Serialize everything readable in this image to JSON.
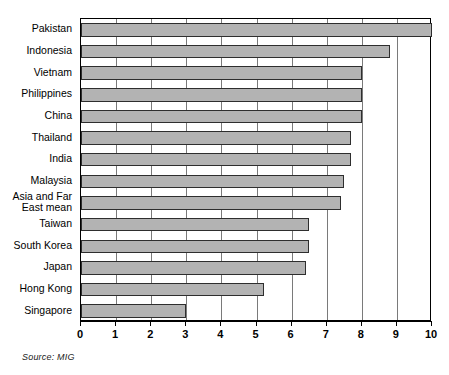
{
  "figure": {
    "source_note": "Source: MIG"
  },
  "chart_data": {
    "type": "bar",
    "orientation": "horizontal",
    "title": "",
    "subtitle": "",
    "xlabel": "",
    "ylabel": "",
    "xlim": [
      0,
      10
    ],
    "grid": true,
    "legend": null,
    "bar_color": "#b3b3b3",
    "bar_edge_color": "#2e2e2e",
    "categories": [
      "Pakistan",
      "Indonesia",
      "Vietnam",
      "Philippines",
      "China",
      "Thailand",
      "India",
      "Malaysia",
      "Asia and Far\nEast mean",
      "Taiwan",
      "South Korea",
      "Japan",
      "Hong Kong",
      "Singapore"
    ],
    "values": [
      10.0,
      8.8,
      8.0,
      8.0,
      8.0,
      7.7,
      7.7,
      7.5,
      7.4,
      6.5,
      6.5,
      6.4,
      5.2,
      3.0
    ],
    "xticks": [
      0,
      1,
      2,
      3,
      4,
      5,
      6,
      7,
      8,
      9,
      10
    ],
    "xticklabels": [
      "0",
      "1",
      "2",
      "3",
      "4",
      "5",
      "6",
      "7",
      "8",
      "9",
      "10"
    ]
  }
}
